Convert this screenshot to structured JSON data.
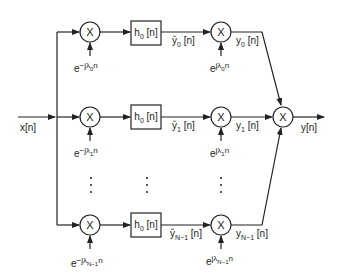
{
  "diagram": {
    "type": "filter-bank-block-diagram",
    "input_label": "x[n]",
    "output_label": "y[n]",
    "multiplier_symbol": "X",
    "combiner_symbol": "X",
    "branches": [
      {
        "index": "0",
        "demod_exp_base": "e",
        "demod_exp_power": "−jλ",
        "demod_exp_sub": "0",
        "demod_exp_tail": "n",
        "filter_label": "h",
        "filter_sub": "0",
        "filter_arg": " [n]",
        "filtered_label": "y̌",
        "filtered_sub": "0",
        "filtered_arg": " [n]",
        "mod_exp_base": "e",
        "mod_exp_power": "jλ",
        "mod_exp_sub": "0",
        "mod_exp_tail": "n",
        "output_label": "y",
        "output_sub": "0",
        "output_arg": " [n]"
      },
      {
        "index": "1",
        "demod_exp_base": "e",
        "demod_exp_power": "−jλ",
        "demod_exp_sub": "1",
        "demod_exp_tail": "n",
        "filter_label": "h",
        "filter_sub": "0",
        "filter_arg": " [n]",
        "filtered_label": "y̌",
        "filtered_sub": "1",
        "filtered_arg": " [n]",
        "mod_exp_base": "e",
        "mod_exp_power": "jλ",
        "mod_exp_sub": "1",
        "mod_exp_tail": "n",
        "output_label": "y",
        "output_sub": "1",
        "output_arg": " [n]"
      },
      {
        "index": "N−1",
        "demod_exp_base": "e",
        "demod_exp_power": "−jλ",
        "demod_exp_sub": "N−1",
        "demod_exp_tail": "n",
        "filter_label": "h",
        "filter_sub": "0",
        "filter_arg": " [n]",
        "filtered_label": "y̌",
        "filtered_sub": "N−1",
        "filtered_arg": " [n]",
        "mod_exp_base": "e",
        "mod_exp_power": "jλ",
        "mod_exp_sub": "N−1",
        "mod_exp_tail": "n",
        "output_label": "y",
        "output_sub": "N−1",
        "output_arg": " [n]"
      }
    ],
    "ellipsis": "⋮",
    "colors": {
      "stroke": "#222222",
      "background": "#ffffff"
    }
  }
}
